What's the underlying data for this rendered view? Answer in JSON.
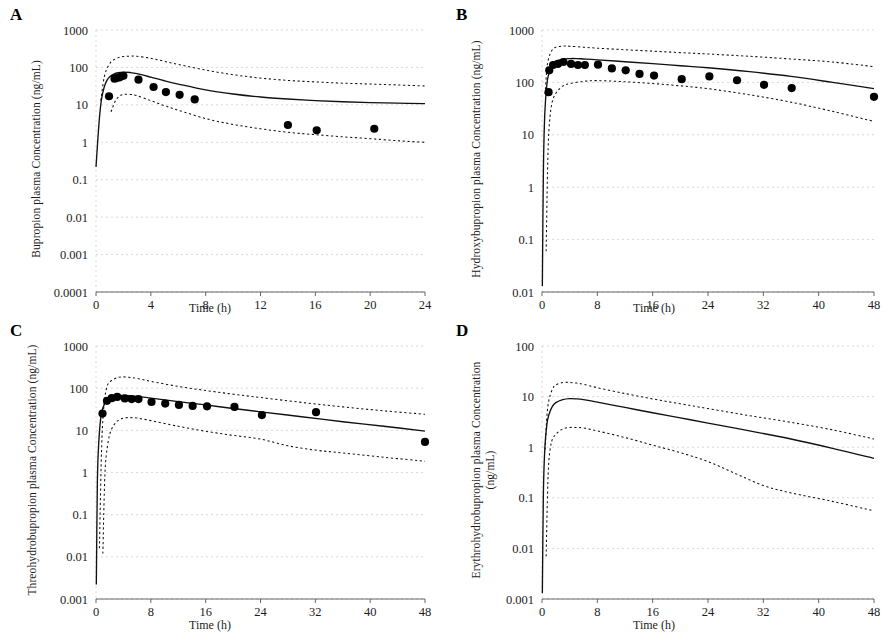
{
  "figure": {
    "background": "#ffffff",
    "ink_color": "#111111"
  },
  "panels": [
    {
      "id": "A",
      "letter": "A",
      "ylabel": "Bupropion plasma Concentration (ng/mL)",
      "xlabel": "Time (h)",
      "ytick_labels": [
        "1000",
        "100",
        "10",
        "1",
        "0.1",
        "0.01",
        "0.001",
        "0.0001"
      ],
      "xtick_labels": [
        "0",
        "4",
        "8",
        "12",
        "16",
        "20",
        "24"
      ]
    },
    {
      "id": "B",
      "letter": "B",
      "ylabel": "Hydroxybupropion plasma Concentration (ng/mL)",
      "xlabel": "Time (h)",
      "ytick_labels": [
        "1000",
        "100",
        "10",
        "1",
        "0.1",
        "0.01"
      ],
      "xtick_labels": [
        "0",
        "8",
        "16",
        "24",
        "32",
        "40",
        "48"
      ]
    },
    {
      "id": "C",
      "letter": "C",
      "ylabel": "Threohydrobupropion plasma Concentration (ng/mL)",
      "xlabel": "Time (h)",
      "ytick_labels": [
        "1000",
        "100",
        "10",
        "1",
        "0.1",
        "0.01",
        "0.001"
      ],
      "xtick_labels": [
        "0",
        "8",
        "16",
        "24",
        "32",
        "40",
        "48"
      ]
    },
    {
      "id": "D",
      "letter": "D",
      "ylabel": "Erythrohydrobupropion plasma Concentration (ng/mL)",
      "xlabel": "Time (h)",
      "ytick_labels": [
        "100",
        "10",
        "1",
        "0.1",
        "0.01",
        "0.001"
      ],
      "xtick_labels": [
        "0",
        "8",
        "16",
        "24",
        "32",
        "40",
        "48"
      ]
    }
  ],
  "chart_data": [
    {
      "type": "line",
      "panel": "A",
      "title": "A",
      "xlabel": "Time (h)",
      "ylabel": "Bupropion plasma Concentration (ng/mL)",
      "yscale": "log",
      "xlim": [
        0,
        24
      ],
      "ylim": [
        0.0001,
        1000
      ],
      "ytick_values": [
        1000,
        100,
        10,
        1,
        0.1,
        0.01,
        0.001,
        0.0001
      ],
      "xtick_values": [
        0,
        4,
        8,
        12,
        16,
        20,
        24
      ],
      "grid": true,
      "legend": "none",
      "series": [
        {
          "name": "Predicted median",
          "style": "solid",
          "x": [
            0.0,
            0.12,
            0.25,
            0.4,
            0.6,
            0.8,
            1.0,
            1.3,
            1.6,
            2.0,
            2.5,
            3.0,
            4.0,
            5.0,
            6.0,
            8.0,
            10.0,
            12.0,
            14.0,
            16.0,
            18.0,
            20.0,
            22.0,
            24.0
          ],
          "y": [
            0.22,
            1.0,
            4.5,
            14.0,
            30.0,
            45.0,
            56.0,
            66.0,
            72.0,
            75.0,
            73.0,
            68.0,
            55.0,
            44.0,
            36.0,
            25.0,
            19.5,
            16.2,
            14.3,
            13.0,
            12.1,
            11.5,
            11.1,
            10.8
          ]
        },
        {
          "name": "95% prediction interval upper",
          "style": "dotted",
          "x": [
            0.35,
            0.6,
            0.9,
            1.2,
            1.6,
            2.0,
            2.5,
            3.0,
            4.0,
            5.0,
            6.0,
            8.0,
            10.0,
            12.0,
            14.0,
            16.0,
            18.0,
            20.0,
            22.0,
            24.0
          ],
          "y": [
            13.0,
            55.0,
            110.0,
            150.0,
            180.0,
            195.0,
            200.0,
            198.0,
            175.0,
            145.0,
            120.0,
            85.0,
            64.0,
            52.0,
            45.0,
            41.0,
            38.0,
            36.0,
            34.0,
            32.0
          ]
        },
        {
          "name": "95% prediction interval lower",
          "style": "dotted",
          "x": [
            1.1,
            1.4,
            1.7,
            2.0,
            2.5,
            3.0,
            4.0,
            5.0,
            6.0,
            8.0,
            10.0,
            12.0,
            14.0,
            16.0,
            18.0,
            20.0,
            22.0,
            24.0
          ],
          "y": [
            6.5,
            12.5,
            17.0,
            19.0,
            19.0,
            17.5,
            13.0,
            9.5,
            7.2,
            4.3,
            3.0,
            2.3,
            1.85,
            1.6,
            1.4,
            1.25,
            1.1,
            1.0
          ]
        }
      ],
      "observed": {
        "name": "Observed data",
        "marker": "filled-circle",
        "x": [
          0.95,
          1.35,
          1.5,
          1.7,
          1.85,
          2.0,
          3.1,
          4.2,
          5.1,
          6.1,
          7.2,
          14.0,
          16.1,
          20.3
        ],
        "y": [
          17.0,
          50.0,
          52.0,
          54.0,
          58.0,
          60.0,
          47.0,
          30.0,
          22.0,
          18.5,
          14.0,
          2.9,
          2.1,
          2.3
        ]
      }
    },
    {
      "type": "line",
      "panel": "B",
      "title": "B",
      "xlabel": "Time (h)",
      "ylabel": "Hydroxybupropion plasma Concentration (ng/mL)",
      "yscale": "log",
      "xlim": [
        0,
        48
      ],
      "ylim": [
        0.01,
        1000
      ],
      "ytick_values": [
        1000,
        100,
        10,
        1,
        0.1,
        0.01
      ],
      "xtick_values": [
        0,
        8,
        16,
        24,
        32,
        40,
        48
      ],
      "grid": true,
      "legend": "none",
      "series": [
        {
          "name": "Predicted median",
          "style": "solid",
          "x": [
            0.05,
            0.2,
            0.4,
            0.7,
            1.0,
            1.5,
            2.0,
            3.0,
            4.0,
            5.0,
            6.0,
            8.0,
            12.0,
            16.0,
            20.0,
            24.0,
            30.0,
            36.0,
            42.0,
            48.0
          ],
          "y": [
            0.013,
            2.0,
            25.0,
            90.0,
            150.0,
            215.0,
            250.0,
            278.0,
            285.0,
            285.0,
            280.0,
            270.0,
            248.0,
            228.0,
            208.0,
            190.0,
            160.0,
            130.0,
            100.0,
            76.0
          ]
        },
        {
          "name": "95% prediction interval upper",
          "style": "dotted",
          "x": [
            0.45,
            0.7,
            1.0,
            1.5,
            2.0,
            3.0,
            4.0,
            6.0,
            8.0,
            12.0,
            16.0,
            20.0,
            24.0,
            30.0,
            36.0,
            42.0,
            48.0
          ],
          "y": [
            60.0,
            180.0,
            300.0,
            420.0,
            470.0,
            495.0,
            490.0,
            470.0,
            450.0,
            420.0,
            395.0,
            370.0,
            348.0,
            315.0,
            280.0,
            245.0,
            200.0
          ]
        },
        {
          "name": "95% prediction interval lower",
          "style": "dotted",
          "x": [
            0.6,
            0.8,
            1.0,
            1.4,
            2.0,
            3.0,
            4.0,
            6.0,
            8.0,
            12.0,
            16.0,
            20.0,
            24.0,
            30.0,
            36.0,
            42.0,
            48.0
          ],
          "y": [
            0.06,
            2.0,
            12.0,
            38.0,
            62.0,
            85.0,
            95.0,
            105.0,
            108.0,
            103.0,
            95.0,
            86.0,
            76.0,
            58.0,
            42.0,
            28.0,
            18.0
          ]
        }
      ],
      "observed": {
        "name": "Observed data",
        "marker": "filled-circle",
        "x": [
          0.95,
          1.05,
          1.6,
          2.3,
          3.1,
          4.2,
          5.2,
          6.2,
          8.1,
          10.1,
          12.1,
          14.1,
          16.2,
          20.2,
          24.2,
          28.2,
          32.1,
          36.1,
          48.0
        ],
        "y": [
          65.0,
          170.0,
          215.0,
          225.0,
          245.0,
          225.0,
          215.0,
          215.0,
          218.0,
          185.0,
          170.0,
          145.0,
          135.0,
          115.0,
          130.0,
          110.0,
          90.0,
          78.0,
          53.0
        ]
      }
    },
    {
      "type": "line",
      "panel": "C",
      "title": "C",
      "xlabel": "Time (h)",
      "ylabel": "Threohydrobupropion plasma Concentration (ng/mL)",
      "yscale": "log",
      "xlim": [
        0,
        48
      ],
      "ylim": [
        0.001,
        1000
      ],
      "ytick_values": [
        1000,
        100,
        10,
        1,
        0.1,
        0.01,
        0.001
      ],
      "xtick_values": [
        0,
        8,
        16,
        24,
        32,
        40,
        48
      ],
      "grid": true,
      "legend": "none",
      "series": [
        {
          "name": "Predicted median",
          "style": "solid",
          "x": [
            0.05,
            0.2,
            0.4,
            0.7,
            1.0,
            1.5,
            2.0,
            3.0,
            4.0,
            5.0,
            6.0,
            8.0,
            12.0,
            16.0,
            20.0,
            24.0,
            30.0,
            36.0,
            42.0,
            48.0
          ],
          "y": [
            0.0022,
            0.6,
            5.0,
            20.0,
            34.0,
            50.0,
            58.0,
            65.0,
            67.0,
            66.0,
            64.0,
            58.0,
            48.0,
            40.0,
            33.0,
            27.5,
            21.0,
            16.0,
            12.5,
            9.6
          ]
        },
        {
          "name": "95% prediction interval upper",
          "style": "dotted",
          "x": [
            0.5,
            0.8,
            1.1,
            1.5,
            2.0,
            3.0,
            4.0,
            5.0,
            6.0,
            8.0,
            12.0,
            16.0,
            20.0,
            24.0,
            30.0,
            36.0,
            42.0,
            48.0
          ],
          "y": [
            0.016,
            3.0,
            30.0,
            95.0,
            140.0,
            175.0,
            185.0,
            180.0,
            170.0,
            145.0,
            110.0,
            88.0,
            72.0,
            60.0,
            46.0,
            36.0,
            29.0,
            24.0
          ]
        },
        {
          "name": "95% prediction interval lower",
          "style": "dotted",
          "x": [
            1.0,
            1.3,
            1.7,
            2.2,
            3.0,
            4.0,
            5.0,
            6.0,
            8.0,
            12.0,
            16.0,
            20.0,
            24.0,
            28.0,
            32.0,
            36.0,
            42.0,
            48.0
          ],
          "y": [
            0.012,
            0.9,
            4.5,
            10.0,
            16.0,
            19.5,
            20.0,
            19.5,
            17.0,
            12.5,
            9.5,
            7.6,
            6.2,
            4.3,
            3.4,
            2.9,
            2.3,
            1.85
          ]
        }
      ],
      "observed": {
        "name": "Observed data",
        "marker": "filled-circle",
        "x": [
          0.95,
          1.6,
          2.3,
          3.1,
          4.2,
          5.2,
          6.2,
          8.1,
          10.1,
          12.1,
          14.1,
          16.2,
          20.2,
          24.2,
          32.1,
          48.0
        ],
        "y": [
          25.0,
          50.0,
          58.0,
          62.0,
          57.0,
          55.0,
          55.0,
          47.0,
          43.0,
          40.0,
          38.0,
          37.0,
          36.0,
          23.0,
          27.0,
          5.3
        ]
      }
    },
    {
      "type": "line",
      "panel": "D",
      "title": "D",
      "xlabel": "Time (h)",
      "ylabel": "Erythrohydrobupropion plasma Concentration (ng/mL)",
      "yscale": "log",
      "xlim": [
        0,
        48
      ],
      "ylim": [
        0.001,
        100
      ],
      "ytick_values": [
        100,
        10,
        1,
        0.1,
        0.01,
        0.001
      ],
      "xtick_values": [
        0,
        8,
        16,
        24,
        32,
        40,
        48
      ],
      "grid": true,
      "legend": "none",
      "series": [
        {
          "name": "Predicted median",
          "style": "solid",
          "x": [
            0.05,
            0.2,
            0.4,
            0.7,
            1.0,
            1.5,
            2.0,
            3.0,
            4.0,
            5.0,
            6.0,
            8.0,
            12.0,
            16.0,
            20.0,
            24.0,
            30.0,
            36.0,
            42.0,
            48.0
          ],
          "y": [
            0.0013,
            0.12,
            0.9,
            2.8,
            4.4,
            6.4,
            7.6,
            8.7,
            9.1,
            9.0,
            8.7,
            7.8,
            6.1,
            4.8,
            3.8,
            3.0,
            2.1,
            1.45,
            0.95,
            0.6
          ]
        },
        {
          "name": "95% prediction interval upper",
          "style": "dotted",
          "x": [
            0.45,
            0.7,
            1.0,
            1.5,
            2.0,
            3.0,
            4.0,
            5.0,
            6.0,
            8.0,
            12.0,
            16.0,
            20.0,
            24.0,
            30.0,
            36.0,
            42.0,
            48.0
          ],
          "y": [
            0.9,
            4.0,
            8.5,
            14.0,
            17.0,
            19.0,
            19.0,
            18.5,
            17.5,
            15.0,
            11.5,
            9.0,
            7.2,
            5.8,
            4.2,
            3.1,
            2.2,
            1.45
          ]
        },
        {
          "name": "95% prediction interval lower",
          "style": "dotted",
          "x": [
            0.6,
            0.8,
            1.0,
            1.4,
            2.0,
            3.0,
            4.0,
            5.0,
            6.0,
            8.0,
            12.0,
            16.0,
            20.0,
            24.0,
            28.0,
            32.0,
            36.0,
            42.0,
            48.0
          ],
          "y": [
            0.007,
            0.12,
            0.55,
            1.3,
            1.8,
            2.3,
            2.45,
            2.45,
            2.4,
            2.1,
            1.55,
            1.1,
            0.78,
            0.52,
            0.3,
            0.175,
            0.125,
            0.085,
            0.055
          ]
        }
      ],
      "observed": {
        "name": "Observed data",
        "marker": "none",
        "x": [],
        "y": []
      }
    }
  ]
}
